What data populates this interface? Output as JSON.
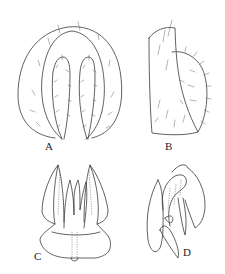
{
  "figure": {
    "panels": [
      {
        "id": "A",
        "label": "A",
        "description": "ventral view, setose lobes"
      },
      {
        "id": "B",
        "label": "B",
        "description": "lateral view, setose lobe"
      },
      {
        "id": "C",
        "label": "C",
        "description": "dorsal view, genital structures"
      },
      {
        "id": "D",
        "label": "D",
        "description": "lateral view, genital structures"
      }
    ],
    "colors": {
      "line": "#3a3a3a",
      "background": "#ffffff"
    }
  }
}
